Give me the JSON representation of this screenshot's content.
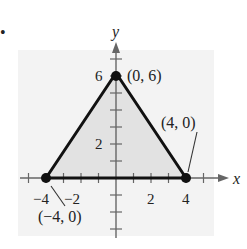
{
  "bullet": "•",
  "chart_data": {
    "type": "line",
    "title": "",
    "xlabel": "x",
    "ylabel": "y",
    "xlim": [
      -5.5,
      6
    ],
    "ylim": [
      -3.5,
      7.5
    ],
    "grid": false,
    "x_ticks": [
      -5,
      -4,
      -3,
      -2,
      -1,
      1,
      2,
      3,
      4,
      5
    ],
    "x_tick_labels": [
      {
        "value": -4,
        "label": "−4"
      },
      {
        "value": -2,
        "label": "−2"
      },
      {
        "value": 2,
        "label": "2"
      },
      {
        "value": 4,
        "label": "4"
      }
    ],
    "y_ticks": [
      -3,
      -2,
      -1,
      1,
      2,
      3,
      4,
      5,
      6,
      7
    ],
    "y_tick_labels": [
      {
        "value": 2,
        "label": "2"
      },
      {
        "value": 6,
        "label": "6"
      }
    ],
    "shape": "filled triangle",
    "vertices": [
      {
        "x": -4,
        "y": 0,
        "label": "(−4, 0)"
      },
      {
        "x": 0,
        "y": 6,
        "label": "(0, 6)"
      },
      {
        "x": 4,
        "y": 0,
        "label": "(4, 0)"
      }
    ],
    "fill_color": "#e4e4e4",
    "stroke_color": "#111111",
    "background_panel_color": "#f4f4f4"
  }
}
